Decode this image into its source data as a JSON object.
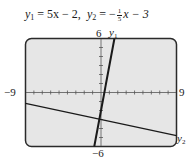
{
  "title": {
    "y1_name": "y",
    "y1_sub": "1",
    "y1_rhs": " = 5x − 2,",
    "y2_name": "y",
    "y2_sub": "2",
    "y2_eq": " = −",
    "y2_frac_num": "1",
    "y2_frac_den": "5",
    "y2_rest": "x − 3"
  },
  "labels": {
    "ymax": "6",
    "ymin": "−6",
    "xmin": "−9",
    "xmax": "9",
    "line1_name": "y",
    "line1_sub": "1",
    "line2_name": "y",
    "line2_sub": "2"
  },
  "colors": {
    "screen_bg": "#e6e6e6",
    "frame": "#2a2a2a",
    "line": "#1a1a1a",
    "axis": "#555555"
  },
  "chart_data": {
    "type": "line",
    "xlabel": "",
    "ylabel": "",
    "xlim": [
      -9,
      9
    ],
    "ylim": [
      -6,
      6
    ],
    "xscale": 1,
    "yscale": 1,
    "grid": false,
    "series": [
      {
        "name": "y1",
        "equation": "y = 5x - 2",
        "slope": 5,
        "intercept": -2,
        "x": [
          -0.8,
          1.6
        ],
        "y": [
          -6,
          6
        ]
      },
      {
        "name": "y2",
        "equation": "y = -(1/5)x - 3",
        "slope": -0.2,
        "intercept": -3,
        "x": [
          -9,
          9
        ],
        "y": [
          -1.2,
          -4.8
        ]
      }
    ],
    "annotations": [
      "intersection near (-0.19, -2.96)"
    ]
  }
}
